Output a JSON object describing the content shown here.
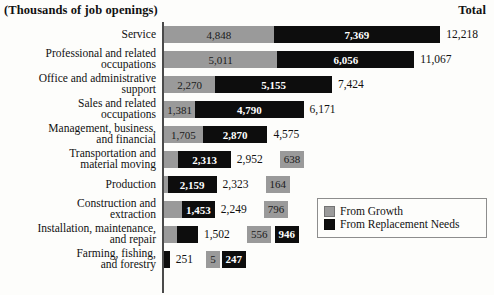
{
  "header": {
    "units_caption": "(Thousands of job openings)",
    "total_header": "Total"
  },
  "legend": {
    "items": [
      {
        "label": "From Growth",
        "color": "#9a9a9a",
        "swatch": "growth-swatch"
      },
      {
        "label": "From Replacement Needs",
        "color": "#0d0d0d",
        "swatch": "replacement-swatch"
      }
    ]
  },
  "chart_data": {
    "type": "bar",
    "orientation": "horizontal",
    "stacked": true,
    "title": "(Thousands of job openings)",
    "xlabel": "",
    "ylabel": "",
    "xlim": [
      0,
      12218
    ],
    "grid": false,
    "legend_position": "inside-right",
    "value_unit": "thousands of job openings",
    "categories": [
      "Service",
      "Professional and related occupations",
      "Office and administrative support",
      "Sales and related occupations",
      "Management, business, and financial",
      "Transportation and material moving",
      "Production",
      "Construction and extraction",
      "Installation, maintenance, and repair",
      "Farming, fishing, and forestry"
    ],
    "category_labels_wrapped": [
      "Service",
      "Professional and related\noccupations",
      "Office and administrative\nsupport",
      "Sales and related\noccupations",
      "Management, business,\nand financial",
      "Transportation and\nmaterial moving",
      "Production",
      "Construction and\nextraction",
      "Installation, maintenance,\nand repair",
      "Farming, fishing,\nand forestry"
    ],
    "series": [
      {
        "name": "From Growth",
        "color": "#9a9a9a",
        "values": [
          4848,
          5011,
          2270,
          1381,
          1705,
          638,
          164,
          796,
          556,
          5
        ]
      },
      {
        "name": "From Replacement Needs",
        "color": "#0d0d0d",
        "values": [
          7369,
          6056,
          5155,
          4790,
          2870,
          2313,
          2159,
          1453,
          946,
          247
        ]
      }
    ],
    "totals": [
      12218,
      11067,
      7424,
      6171,
      4575,
      2952,
      2323,
      2249,
      1502,
      251
    ]
  },
  "rows": [
    {
      "label": "Service",
      "growth_label": "4,848",
      "replace_label": "7,369",
      "total_label": "12,218",
      "growth": 4848,
      "replace": 7369,
      "total": 12218,
      "detached_growth": false
    },
    {
      "label": "Professional and related\noccupations",
      "growth_label": "5,011",
      "replace_label": "6,056",
      "total_label": "11,067",
      "growth": 5011,
      "replace": 6056,
      "total": 11067,
      "detached_growth": false
    },
    {
      "label": "Office and administrative\nsupport",
      "growth_label": "2,270",
      "replace_label": "5,155",
      "total_label": "7,424",
      "growth": 2270,
      "replace": 5155,
      "total": 7424,
      "detached_growth": false
    },
    {
      "label": "Sales and related\noccupations",
      "growth_label": "1,381",
      "replace_label": "4,790",
      "total_label": "6,171",
      "growth": 1381,
      "replace": 4790,
      "total": 6171,
      "detached_growth": false
    },
    {
      "label": "Management, business,\nand financial",
      "growth_label": "1,705",
      "replace_label": "2,870",
      "total_label": "4,575",
      "growth": 1705,
      "replace": 2870,
      "total": 4575,
      "detached_growth": false
    },
    {
      "label": "Transportation and\nmaterial moving",
      "growth_label": "638",
      "replace_label": "2,313",
      "total_label": "2,952",
      "growth": 638,
      "replace": 2313,
      "total": 2952,
      "detached_growth": true
    },
    {
      "label": "Production",
      "growth_label": "164",
      "replace_label": "2,159",
      "total_label": "2,323",
      "growth": 164,
      "replace": 2159,
      "total": 2323,
      "detached_growth": true
    },
    {
      "label": "Construction and\nextraction",
      "growth_label": "796",
      "replace_label": "1,453",
      "total_label": "2,249",
      "growth": 796,
      "replace": 1453,
      "total": 2249,
      "detached_growth": true
    },
    {
      "label": "Installation, maintenance,\nand repair",
      "growth_label": "556",
      "replace_label": "946",
      "total_label": "1,502",
      "growth": 556,
      "replace": 946,
      "total": 1502,
      "detached_growth": true
    },
    {
      "label": "Farming, fishing,\nand forestry",
      "growth_label": "5",
      "replace_label": "247",
      "total_label": "251",
      "growth": 5,
      "replace": 247,
      "total": 251,
      "detached_growth": true
    }
  ]
}
